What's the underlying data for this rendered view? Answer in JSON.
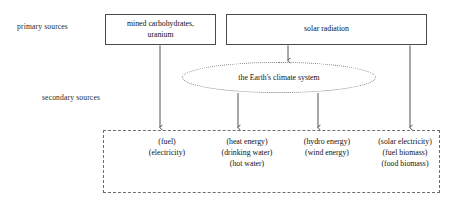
{
  "diagram": {
    "side_labels": {
      "primary": "primary sources",
      "secondary": "secondary sources"
    },
    "primary_sources": [
      {
        "id": "mined",
        "line1": "mined carbohydrates,",
        "line2": "uranium"
      },
      {
        "id": "solar",
        "line1": "solar radiation",
        "line2": ""
      }
    ],
    "system": {
      "label": "the Earth's climate system"
    },
    "secondary_outputs": [
      {
        "id": "fuel-electricity",
        "lines": [
          "(fuel)",
          "(electricity)"
        ]
      },
      {
        "id": "heat-water",
        "lines": [
          "(heat energy)",
          "(drinking water)",
          "(hot water)"
        ]
      },
      {
        "id": "hydro-wind",
        "lines": [
          "(hydro energy)",
          "(wind energy)"
        ]
      },
      {
        "id": "solar-biomass",
        "lines": [
          "(solar electricity)",
          "(fuel biomass)",
          "(food biomass)"
        ]
      }
    ],
    "colors": {
      "box_border": "#4a4a4a",
      "dashed_border": "#6f6f6f",
      "dotted_border": "#7a7a7a",
      "arrow": "#3c3c3c",
      "text": "#111111",
      "background": "#ffffff"
    }
  }
}
